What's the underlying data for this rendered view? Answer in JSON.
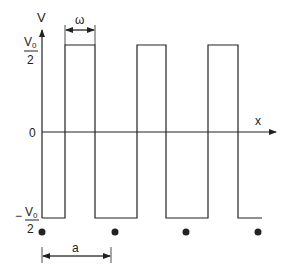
{
  "diagram": {
    "type": "square-wave",
    "axes": {
      "y_label": "V",
      "x_label": "x",
      "origin_label": "0"
    },
    "levels": {
      "high": {
        "numerator": "V0",
        "numerator_base": "V",
        "numerator_sub": "0",
        "denominator": "2",
        "sign": ""
      },
      "low": {
        "numerator": "V0",
        "numerator_base": "V",
        "numerator_sub": "0",
        "denominator": "2",
        "sign": "−"
      }
    },
    "dimensions": {
      "pulse_width_label": "ω",
      "period_label": "a"
    },
    "lattice_points": 4,
    "colors": {
      "line": "#222222",
      "background": "#ffffff"
    }
  }
}
